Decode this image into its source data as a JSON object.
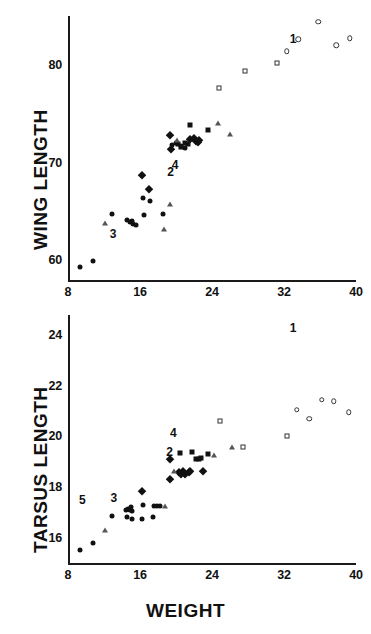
{
  "figure": {
    "xlabel": "WEIGHT"
  },
  "chart_data": [
    {
      "type": "scatter",
      "title": "",
      "panel": "top",
      "xlabel": "",
      "ylabel": "WING  LENGTH",
      "xlim": [
        8,
        40
      ],
      "ylim": [
        58,
        85
      ],
      "xticks": [
        8,
        16,
        24,
        32,
        40
      ],
      "yticks": [
        60,
        70,
        80
      ],
      "xtick_labels": [
        "8",
        "16",
        "24",
        "32",
        "40"
      ],
      "ytick_labels": [
        "60",
        "70",
        "80"
      ],
      "grid": false,
      "legend": "none",
      "annotations": [
        {
          "text": "1",
          "x": 33.0,
          "y": 82.6
        },
        {
          "text": "2",
          "x": 19.4,
          "y": 69.0
        },
        {
          "text": "3",
          "x": 13.0,
          "y": 62.7
        },
        {
          "text": "4",
          "x": 19.9,
          "y": 69.8
        }
      ],
      "series": [
        {
          "name": "filled-circle",
          "marker": "filled-circle",
          "points": [
            [
              9.3,
              59.3
            ],
            [
              10.8,
              59.9
            ],
            [
              12.9,
              64.7
            ],
            [
              14.6,
              64.1
            ],
            [
              14.9,
              63.9
            ],
            [
              15.1,
              64.0
            ],
            [
              15.2,
              63.7
            ],
            [
              15.5,
              63.6
            ],
            [
              16.4,
              64.6
            ],
            [
              16.3,
              66.4
            ],
            [
              17.1,
              66.1
            ],
            [
              18.5,
              64.7
            ],
            [
              19.5,
              71.8
            ],
            [
              20.0,
              72.0
            ],
            [
              20.6,
              71.7
            ],
            [
              21.0,
              71.5
            ]
          ]
        },
        {
          "name": "filled-diamond",
          "marker": "filled-diamond",
          "points": [
            [
              16.2,
              68.7
            ],
            [
              17.0,
              67.3
            ],
            [
              19.3,
              72.8
            ],
            [
              19.4,
              71.4
            ],
            [
              21.6,
              72.4
            ],
            [
              22.0,
              72.5
            ],
            [
              22.2,
              72.2
            ],
            [
              22.4,
              72.1
            ],
            [
              22.6,
              72.3
            ]
          ]
        },
        {
          "name": "filled-square",
          "marker": "filled-square",
          "points": [
            [
              20.2,
              71.9
            ],
            [
              20.5,
              71.6
            ],
            [
              21.5,
              73.9
            ],
            [
              21.0,
              72.0
            ],
            [
              21.3,
              71.9
            ],
            [
              23.6,
              73.3
            ]
          ]
        },
        {
          "name": "open-triangle",
          "marker": "open-triangle",
          "points": [
            [
              12.1,
              63.8
            ],
            [
              18.7,
              63.2
            ],
            [
              19.3,
              65.8
            ],
            [
              20.1,
              72.3
            ],
            [
              24.7,
              74.1
            ],
            [
              26.0,
              72.9
            ]
          ]
        },
        {
          "name": "open-square",
          "marker": "open-square",
          "points": [
            [
              24.8,
              77.6
            ],
            [
              27.7,
              79.4
            ],
            [
              31.2,
              80.2
            ]
          ]
        },
        {
          "name": "open-circle",
          "marker": "open-circle",
          "points": [
            [
              32.3,
              81.4
            ],
            [
              33.6,
              82.6
            ],
            [
              35.8,
              84.4
            ],
            [
              37.8,
              82.0
            ],
            [
              39.3,
              82.7
            ]
          ]
        }
      ]
    },
    {
      "type": "scatter",
      "title": "",
      "panel": "bottom",
      "xlabel": "WEIGHT",
      "ylabel": "TARSUS  LENGTH",
      "xlim": [
        8,
        40
      ],
      "ylim": [
        15,
        24.8
      ],
      "xticks": [
        8,
        16,
        24,
        32,
        40
      ],
      "yticks": [
        16,
        18,
        20,
        22,
        24
      ],
      "xtick_labels": [
        "8",
        "16",
        "18",
        "20",
        "22",
        "24"
      ],
      "ytick_labels": [
        "16",
        "18",
        "20",
        "22",
        "24"
      ],
      "grid": false,
      "legend": "none",
      "annotations": [
        {
          "text": "1",
          "x": 33.0,
          "y": 24.3
        },
        {
          "text": "2",
          "x": 19.3,
          "y": 19.4
        },
        {
          "text": "3",
          "x": 13.1,
          "y": 17.55
        },
        {
          "text": "4",
          "x": 19.7,
          "y": 20.15
        },
        {
          "text": "5",
          "x": 9.6,
          "y": 17.5
        }
      ],
      "series": [
        {
          "name": "filled-circle",
          "marker": "filled-circle",
          "points": [
            [
              9.3,
              15.5
            ],
            [
              10.8,
              15.8
            ],
            [
              12.9,
              16.85
            ],
            [
              14.4,
              17.1
            ],
            [
              14.7,
              17.15
            ],
            [
              14.9,
              17.1
            ],
            [
              15.0,
              17.2
            ],
            [
              15.1,
              17.05
            ],
            [
              14.6,
              16.8
            ],
            [
              15.1,
              16.75
            ],
            [
              16.3,
              17.3
            ],
            [
              16.2,
              16.75
            ],
            [
              17.5,
              17.25
            ],
            [
              17.9,
              17.25
            ],
            [
              18.2,
              17.25
            ],
            [
              17.4,
              16.8
            ]
          ]
        },
        {
          "name": "filled-diamond",
          "marker": "filled-diamond",
          "points": [
            [
              16.2,
              17.85
            ],
            [
              19.3,
              19.1
            ],
            [
              19.3,
              18.3
            ],
            [
              20.8,
              18.65
            ],
            [
              21.0,
              18.5
            ],
            [
              21.4,
              18.6
            ],
            [
              21.6,
              18.65
            ],
            [
              20.3,
              18.6
            ],
            [
              20.6,
              18.5
            ],
            [
              23.0,
              18.65
            ]
          ]
        },
        {
          "name": "filled-square",
          "marker": "filled-square",
          "points": [
            [
              20.4,
              19.35
            ],
            [
              21.8,
              19.4
            ],
            [
              22.2,
              19.1
            ],
            [
              22.5,
              19.1
            ],
            [
              22.8,
              19.15
            ],
            [
              23.5,
              19.3
            ]
          ]
        },
        {
          "name": "open-triangle",
          "marker": "open-triangle",
          "points": [
            [
              12.1,
              16.3
            ],
            [
              18.8,
              17.25
            ],
            [
              19.8,
              18.65
            ],
            [
              24.2,
              19.25
            ],
            [
              26.2,
              19.6
            ]
          ]
        },
        {
          "name": "open-square",
          "marker": "open-square",
          "points": [
            [
              24.9,
              20.6
            ],
            [
              27.4,
              19.6
            ],
            [
              32.3,
              20.0
            ]
          ]
        },
        {
          "name": "open-circle",
          "marker": "open-circle",
          "points": [
            [
              33.4,
              21.05
            ],
            [
              34.8,
              20.7
            ],
            [
              36.2,
              21.45
            ],
            [
              37.5,
              21.4
            ],
            [
              39.2,
              20.95
            ]
          ]
        }
      ]
    }
  ]
}
